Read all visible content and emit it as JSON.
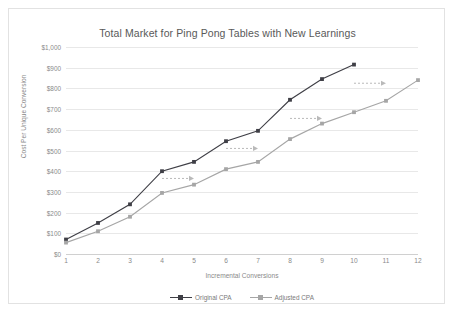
{
  "chart_data": {
    "type": "line",
    "title": "Total Market for Ping Pong Tables with New Learnings",
    "xlabel": "Incremental Conversions",
    "ylabel": "Cost Per Unique Conversion",
    "x": [
      1,
      2,
      3,
      4,
      5,
      6,
      7,
      8,
      9,
      10,
      11,
      12
    ],
    "categories": [
      "1",
      "2",
      "3",
      "4",
      "5",
      "6",
      "7",
      "8",
      "9",
      "10",
      "11",
      "12"
    ],
    "xlim": [
      1,
      12
    ],
    "ylim": [
      0,
      1000
    ],
    "ytick_values": [
      0,
      100,
      200,
      300,
      400,
      500,
      600,
      700,
      800,
      900,
      1000
    ],
    "ytick_labels": [
      "$0",
      "$100",
      "$200",
      "$300",
      "$400",
      "$500",
      "$600",
      "$700",
      "$800",
      "$900",
      "$1,000"
    ],
    "grid": true,
    "legend_position": "bottom",
    "series": [
      {
        "name": "Original CPA",
        "color": "#3f3f46",
        "marker": "square",
        "x": [
          1,
          2,
          3,
          4,
          5,
          6,
          7,
          8,
          9,
          10
        ],
        "values": [
          70,
          150,
          240,
          400,
          445,
          545,
          595,
          745,
          845,
          915
        ]
      },
      {
        "name": "Adjusted CPA",
        "color": "#a6a6a6",
        "marker": "square",
        "x": [
          1,
          2,
          3,
          4,
          5,
          6,
          7,
          8,
          9,
          10,
          11,
          12
        ],
        "values": [
          55,
          110,
          180,
          295,
          335,
          410,
          445,
          555,
          630,
          685,
          740,
          840
        ]
      }
    ],
    "annotations": [
      {
        "type": "dashed-arrow",
        "label": "",
        "x_start": 4,
        "y_start": 365,
        "x_end": 5,
        "y_end": 365
      },
      {
        "type": "dashed-arrow",
        "label": "",
        "x_start": 6,
        "y_start": 510,
        "x_end": 7,
        "y_end": 510
      },
      {
        "type": "dashed-arrow",
        "label": "",
        "x_start": 8,
        "y_start": 655,
        "x_end": 9,
        "y_end": 655
      },
      {
        "type": "dashed-arrow",
        "label": "",
        "x_start": 10,
        "y_start": 825,
        "x_end": 11,
        "y_end": 825
      }
    ]
  },
  "colors": {
    "original_cpa": "#3f3f46",
    "adjusted_cpa": "#a6a6a6",
    "grid": "#e8e8e8",
    "text": "#8a8a8a",
    "annotation": "#b9b9b9"
  }
}
